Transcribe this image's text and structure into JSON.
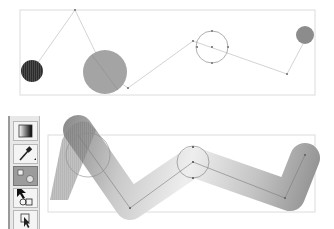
{
  "app": {
    "title": "Blend along path illustration"
  },
  "top_panel": {
    "label": "Blend objects before path replacement",
    "bounds": {
      "x": 20,
      "y": 10,
      "w": 295,
      "h": 85
    },
    "spine_points": [
      [
        32,
        71
      ],
      [
        75,
        10
      ],
      [
        105,
        72
      ],
      [
        128,
        88
      ],
      [
        193,
        41
      ],
      [
        287,
        74
      ],
      [
        304,
        42
      ]
    ],
    "shapes": [
      {
        "name": "dark-hatched-circle",
        "cx": 32,
        "cy": 71,
        "r": 11,
        "fill": "#2a2a2a"
      },
      {
        "name": "large-gray-circle",
        "cx": 105,
        "cy": 72,
        "r": 22,
        "fill": "#a3a3a3"
      },
      {
        "name": "outlined-circle",
        "cx": 212,
        "cy": 47,
        "r": 16,
        "fill": "none"
      },
      {
        "name": "small-gray-circle",
        "cx": 305,
        "cy": 35,
        "r": 9,
        "fill": "#8c8c8c"
      }
    ]
  },
  "bottom_panel": {
    "label": "Blend following replaced spine",
    "bounds": {
      "x": 48,
      "y": 135,
      "w": 267,
      "h": 77
    },
    "spine_points": [
      [
        78,
        135
      ],
      [
        130,
        212
      ],
      [
        193,
        162
      ],
      [
        285,
        200
      ],
      [
        305,
        155
      ]
    ],
    "colors": {
      "start": "#8a8a8a",
      "middle": "#efefef",
      "end": "#8c8c8c"
    },
    "outlined_circles": [
      {
        "cx": 88,
        "cy": 155,
        "r": 22
      },
      {
        "cx": 193,
        "cy": 162,
        "r": 16
      }
    ]
  },
  "toolbar": {
    "tools": [
      {
        "name": "gradient-tool",
        "label": "Gradient"
      },
      {
        "name": "eyedropper-tool",
        "label": "Eyedropper"
      },
      {
        "name": "blend-tool",
        "label": "Blend",
        "active": true
      },
      {
        "name": "direct-selection-tool",
        "label": "Direct Selection"
      },
      {
        "name": "live-paint-selection-tool",
        "label": "Live Paint Selection"
      }
    ]
  }
}
